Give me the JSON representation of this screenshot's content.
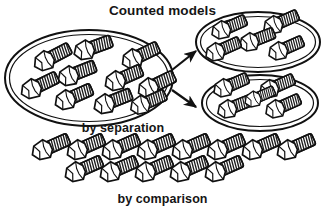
{
  "figure": {
    "title": "Counted models",
    "background_color": "#ffffff",
    "stroke_color": "#111111",
    "fill_color": "#ffffff",
    "hatch_color": "#2a2a2a",
    "labels": {
      "separation": "by separation",
      "comparison": "by comparison"
    },
    "groups": [
      {
        "name": "source-set",
        "shape": "ellipse",
        "item_count": 10,
        "center": [
          89,
          78
        ],
        "radii": [
          84,
          48
        ]
      },
      {
        "name": "separated-set-upper",
        "shape": "ellipse",
        "item_count": 5,
        "center": [
          258,
          42
        ],
        "radii": [
          60,
          28
        ]
      },
      {
        "name": "separated-set-lower",
        "shape": "ellipse",
        "item_count": 5,
        "center": [
          260,
          103
        ],
        "radii": [
          56,
          27
        ]
      },
      {
        "name": "comparison-row-upper",
        "shape": "row",
        "item_count": 8
      },
      {
        "name": "comparison-row-lower",
        "shape": "row",
        "item_count": 5
      }
    ],
    "arrows": [
      {
        "name": "arrow-to-upper-set",
        "from": [
          171,
          68
        ],
        "to": [
          197,
          50
        ],
        "direction": "up-right"
      },
      {
        "name": "arrow-to-lower-set",
        "from": [
          171,
          90
        ],
        "to": [
          197,
          106
        ],
        "direction": "down-right"
      }
    ],
    "bolt_icon": {
      "semantic_name": "hex-bolt-icon",
      "head": "hexagon",
      "shaft": "threaded-cylinder",
      "total_items_drawn": 33
    },
    "bolts": {
      "source_set": [
        {
          "x": 43,
          "y": 62,
          "rot": -28,
          "s": 1.0
        },
        {
          "x": 83,
          "y": 51,
          "rot": -20,
          "s": 1.0
        },
        {
          "x": 131,
          "y": 60,
          "rot": -26,
          "s": 1.0
        },
        {
          "x": 67,
          "y": 77,
          "rot": -22,
          "s": 1.0
        },
        {
          "x": 30,
          "y": 90,
          "rot": -26,
          "s": 1.0
        },
        {
          "x": 114,
          "y": 82,
          "rot": -24,
          "s": 1.0
        },
        {
          "x": 147,
          "y": 89,
          "rot": -26,
          "s": 1.0
        },
        {
          "x": 64,
          "y": 101,
          "rot": -24,
          "s": 1.0
        },
        {
          "x": 103,
          "y": 105,
          "rot": -22,
          "s": 1.0
        },
        {
          "x": 139,
          "y": 106,
          "rot": -24,
          "s": 0.95
        }
      ],
      "upper_set": [
        {
          "x": 222,
          "y": 31,
          "rot": -24,
          "s": 0.95
        },
        {
          "x": 272,
          "y": 28,
          "rot": -24,
          "s": 0.95
        },
        {
          "x": 251,
          "y": 43,
          "rot": -22,
          "s": 0.95
        },
        {
          "x": 215,
          "y": 53,
          "rot": -24,
          "s": 0.95
        },
        {
          "x": 281,
          "y": 52,
          "rot": -24,
          "s": 0.95
        }
      ],
      "lower_set": [
        {
          "x": 228,
          "y": 90,
          "rot": -24,
          "s": 0.95
        },
        {
          "x": 270,
          "y": 92,
          "rot": -24,
          "s": 0.95
        },
        {
          "x": 234,
          "y": 112,
          "rot": -22,
          "s": 0.95
        },
        {
          "x": 281,
          "y": 112,
          "rot": -24,
          "s": 0.95
        }
      ],
      "comparison_upper": [
        {
          "x": 41,
          "y": 151,
          "rot": -24,
          "s": 1.0
        },
        {
          "x": 76,
          "y": 151,
          "rot": -24,
          "s": 1.0
        },
        {
          "x": 111,
          "y": 151,
          "rot": -24,
          "s": 1.0
        },
        {
          "x": 146,
          "y": 151,
          "rot": -24,
          "s": 1.0
        },
        {
          "x": 181,
          "y": 151,
          "rot": -24,
          "s": 1.0
        },
        {
          "x": 216,
          "y": 151,
          "rot": -24,
          "s": 1.0
        },
        {
          "x": 251,
          "y": 151,
          "rot": -24,
          "s": 1.0
        },
        {
          "x": 286,
          "y": 151,
          "rot": -24,
          "s": 1.0
        }
      ],
      "comparison_lower": [
        {
          "x": 74,
          "y": 173,
          "rot": -24,
          "s": 1.0
        },
        {
          "x": 109,
          "y": 173,
          "rot": -24,
          "s": 1.0
        },
        {
          "x": 144,
          "y": 173,
          "rot": -24,
          "s": 1.0
        },
        {
          "x": 179,
          "y": 173,
          "rot": -24,
          "s": 1.0
        },
        {
          "x": 214,
          "y": 173,
          "rot": -24,
          "s": 1.0
        }
      ]
    }
  }
}
